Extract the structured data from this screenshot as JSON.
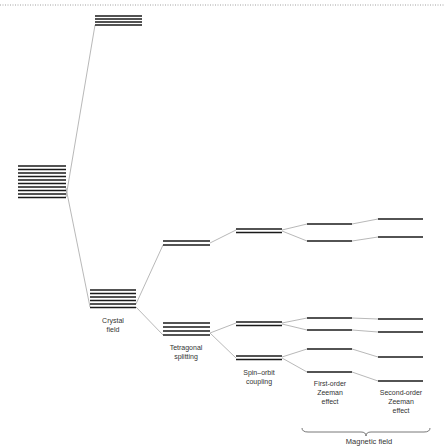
{
  "diagram": {
    "colors": {
      "level": "#1a1a1a",
      "connector": "#9a9a9a",
      "border": "#888888"
    },
    "stages": [
      {
        "id": "free-ion-upper",
        "x1": 95,
        "x2": 142,
        "levels": [
          16,
          19,
          22,
          25
        ]
      },
      {
        "id": "free-ion",
        "x1": 18,
        "x2": 66,
        "levels": [
          166,
          169.5,
          173,
          176.5,
          180,
          183.5,
          187,
          190.5,
          194,
          197.5
        ]
      },
      {
        "id": "crystal-field",
        "x1": 90,
        "x2": 136,
        "levels": [
          290,
          293.5,
          297,
          300.5,
          304,
          307.5
        ]
      },
      {
        "id": "tetragonal-upper",
        "x1": 163,
        "x2": 210,
        "levels": [
          241,
          245
        ]
      },
      {
        "id": "tetragonal-lower",
        "x1": 163,
        "x2": 210,
        "levels": [
          323,
          327,
          331,
          335
        ]
      },
      {
        "id": "spin-orbit-a",
        "x1": 236,
        "x2": 282,
        "levels": [
          229,
          232.5
        ]
      },
      {
        "id": "spin-orbit-b",
        "x1": 236,
        "x2": 282,
        "levels": [
          322,
          325.5
        ]
      },
      {
        "id": "spin-orbit-c",
        "x1": 236,
        "x2": 282,
        "levels": [
          356,
          359.5
        ]
      },
      {
        "id": "first-order",
        "x1": 307,
        "x2": 352,
        "levels": [
          224,
          241,
          318,
          330,
          349,
          372
        ]
      },
      {
        "id": "second-order",
        "x1": 378,
        "x2": 423,
        "levels": [
          219,
          237,
          319,
          332,
          357,
          381
        ]
      }
    ],
    "connectors": [
      [
        66,
        197,
        95,
        25
      ],
      [
        66,
        188,
        90,
        307
      ],
      [
        136,
        304,
        163,
        245
      ],
      [
        136,
        307,
        163,
        335
      ],
      [
        210,
        243,
        236,
        230
      ],
      [
        210,
        333,
        236,
        323
      ],
      [
        210,
        333,
        236,
        358
      ],
      [
        282,
        230,
        307,
        224
      ],
      [
        282,
        231,
        307,
        241
      ],
      [
        282,
        323,
        307,
        318
      ],
      [
        282,
        324,
        307,
        330
      ],
      [
        282,
        357,
        307,
        349
      ],
      [
        282,
        358,
        307,
        372
      ],
      [
        352,
        224,
        378,
        219
      ],
      [
        352,
        241,
        378,
        237
      ],
      [
        352,
        318,
        378,
        319
      ],
      [
        352,
        330,
        378,
        332
      ],
      [
        352,
        349,
        378,
        357
      ],
      [
        352,
        372,
        378,
        381
      ]
    ],
    "labels": {
      "crystal_field": "Crystal\nfield",
      "tetragonal": "Tetragonal\nsplitting",
      "spin_orbit": "Spin–orbit\ncoupling",
      "first_order": "First-order\nZeeman\neffect",
      "second_order": "Second-order\nZeeman\neffect",
      "magnetic_field": "Magnetic field"
    },
    "brace": {
      "x1": 302,
      "x2": 430,
      "y": 432
    }
  }
}
